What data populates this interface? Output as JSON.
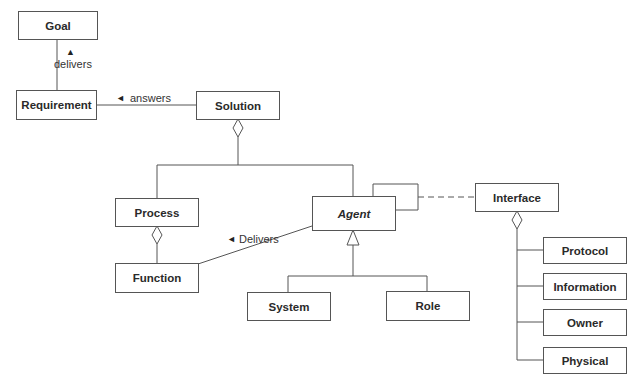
{
  "diagram": {
    "type": "UML class diagram",
    "classes": {
      "goal": "Goal",
      "requirement": "Requirement",
      "solution": "Solution",
      "process": "Process",
      "function": "Function",
      "agent": "Agent",
      "system": "System",
      "role": "Role",
      "interface": "Interface",
      "protocol": "Protocol",
      "information": "Information",
      "owner": "Owner",
      "physical": "Physical"
    },
    "associations": {
      "delivers_goal": {
        "arrow": "▲",
        "label": "delivers",
        "from": "Requirement",
        "to": "Goal"
      },
      "answers": {
        "arrow": "◄",
        "label": "answers",
        "from": "Solution",
        "to": "Requirement"
      },
      "delivers_function": {
        "arrow": "◄",
        "label": "Delivers",
        "from": "Agent",
        "to": "Function"
      }
    },
    "relations": [
      {
        "kind": "aggregation",
        "whole": "Solution",
        "parts": [
          "Process",
          "Agent"
        ]
      },
      {
        "kind": "aggregation",
        "whole": "Process",
        "parts": [
          "Function"
        ]
      },
      {
        "kind": "generalization",
        "parent": "Agent",
        "children": [
          "System",
          "Role"
        ]
      },
      {
        "kind": "self-association",
        "class": "Agent"
      },
      {
        "kind": "dependency (dashed)",
        "from": "Agent",
        "to": "Interface"
      },
      {
        "kind": "aggregation",
        "whole": "Interface",
        "parts": [
          "Protocol",
          "Information",
          "Owner",
          "Physical"
        ]
      }
    ],
    "colors": {
      "line": "#555555",
      "text": "#2a2a2a",
      "background": "#ffffff"
    }
  }
}
